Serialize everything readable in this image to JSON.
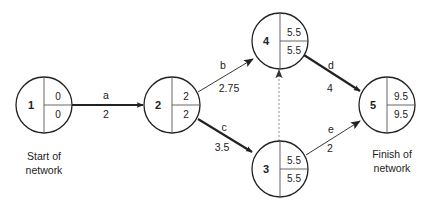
{
  "diagram": {
    "type": "network-activity-on-arrow",
    "nodes": [
      {
        "id": "1",
        "label": "1",
        "top": "0",
        "bottom": "0",
        "cx": 44,
        "cy": 105,
        "r": 28
      },
      {
        "id": "2",
        "label": "2",
        "top": "2",
        "bottom": "2",
        "cx": 172,
        "cy": 105,
        "r": 28
      },
      {
        "id": "3",
        "label": "3",
        "top": "5.5",
        "bottom": "5.5",
        "cx": 280,
        "cy": 169,
        "r": 28
      },
      {
        "id": "4",
        "label": "4",
        "top": "5.5",
        "bottom": "5.5",
        "cx": 280,
        "cy": 41,
        "r": 28
      },
      {
        "id": "5",
        "label": "5",
        "top": "9.5",
        "bottom": "9.5",
        "cx": 387,
        "cy": 105,
        "r": 28
      }
    ],
    "edges": [
      {
        "from": "1",
        "to": "2",
        "activity": "a",
        "duration": "2",
        "critical": true
      },
      {
        "from": "2",
        "to": "4",
        "activity": "b",
        "duration": "2.75",
        "critical": false
      },
      {
        "from": "2",
        "to": "3",
        "activity": "c",
        "duration": "3.5",
        "critical": true
      },
      {
        "from": "3",
        "to": "4",
        "activity": "",
        "duration": "",
        "dummy": true
      },
      {
        "from": "4",
        "to": "5",
        "activity": "d",
        "duration": "4",
        "critical": true
      },
      {
        "from": "3",
        "to": "5",
        "activity": "e",
        "duration": "2",
        "critical": false
      }
    ],
    "captions": {
      "start_line1": "Start of",
      "start_line2": "network",
      "finish_line1": "Finish of",
      "finish_line2": "network"
    },
    "colors": {
      "line": "#222222",
      "divider": "#555555",
      "dummy": "#888888"
    }
  }
}
